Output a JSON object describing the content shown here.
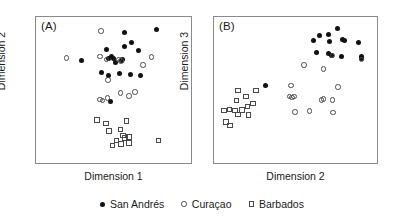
{
  "figure": {
    "panels": [
      {
        "letter": "(A)",
        "xlabel": "Dimension 1",
        "ylabel": "Dimension 2"
      },
      {
        "letter": "(B)",
        "xlabel": "Dimension 2",
        "ylabel": "Dimension 3"
      }
    ]
  },
  "legend": {
    "entries": [
      {
        "label": "San Andrés",
        "marker": "filled-circle"
      },
      {
        "label": "Curaçao",
        "marker": "open-circle"
      },
      {
        "label": "Barbados",
        "marker": "open-square"
      }
    ]
  },
  "chart_data": [
    {
      "type": "scatter",
      "title": "(A)",
      "xlabel": "Dimension 1",
      "ylabel": "Dimension 2",
      "xlim": [
        0,
        1
      ],
      "ylim": [
        0,
        1
      ],
      "grid": false,
      "axis_ticks": false,
      "legend_position": "bottom-outside",
      "series": [
        {
          "name": "San Andrés",
          "marker": "filled-circle",
          "color": "#111111",
          "points": [
            [
              0.572,
              0.108
            ],
            [
              0.775,
              0.084
            ],
            [
              0.452,
              0.223
            ],
            [
              0.573,
              0.203
            ],
            [
              0.617,
              0.176
            ],
            [
              0.662,
              0.23
            ],
            [
              0.291,
              0.3
            ],
            [
              0.47,
              0.281
            ],
            [
              0.49,
              0.272
            ],
            [
              0.497,
              0.284
            ],
            [
              0.553,
              0.297
            ],
            [
              0.56,
              0.288
            ],
            [
              0.515,
              0.312
            ],
            [
              0.42,
              0.383
            ],
            [
              0.465,
              0.4
            ],
            [
              0.54,
              0.385
            ],
            [
              0.61,
              0.395
            ],
            [
              0.675,
              0.4
            ],
            [
              0.482,
              0.58
            ]
          ]
        },
        {
          "name": "Curaçao",
          "marker": "open-circle",
          "color": "#4a4a4a",
          "points": [
            [
              0.42,
              0.095
            ],
            [
              0.197,
              0.28
            ],
            [
              0.413,
              0.27
            ],
            [
              0.455,
              0.29
            ],
            [
              0.535,
              0.292
            ],
            [
              0.548,
              0.3
            ],
            [
              0.745,
              0.275
            ],
            [
              0.69,
              0.33
            ],
            [
              0.466,
              0.432
            ],
            [
              0.545,
              0.52
            ],
            [
              0.462,
              0.555
            ],
            [
              0.6,
              0.54
            ],
            [
              0.638,
              0.512
            ],
            [
              0.412,
              0.565
            ],
            [
              0.43,
              0.572
            ]
          ]
        },
        {
          "name": "Barbados",
          "marker": "open-square",
          "color": "#4a4a4a",
          "points": [
            [
              0.395,
              0.705
            ],
            [
              0.452,
              0.73
            ],
            [
              0.585,
              0.712
            ],
            [
              0.47,
              0.78
            ],
            [
              0.545,
              0.77
            ],
            [
              0.56,
              0.81
            ],
            [
              0.575,
              0.83
            ],
            [
              0.6,
              0.822
            ],
            [
              0.52,
              0.845
            ],
            [
              0.548,
              0.87
            ],
            [
              0.495,
              0.88
            ],
            [
              0.6,
              0.862
            ],
            [
              0.79,
              0.845
            ]
          ]
        }
      ]
    },
    {
      "type": "scatter",
      "title": "(B)",
      "xlabel": "Dimension 2",
      "ylabel": "Dimension 3",
      "xlim": [
        0,
        1
      ],
      "ylim": [
        0,
        1
      ],
      "grid": false,
      "axis_ticks": false,
      "legend_position": "bottom-outside",
      "series": [
        {
          "name": "San Andrés",
          "marker": "filled-circle",
          "color": "#111111",
          "points": [
            [
              0.757,
              0.078
            ],
            [
              0.65,
              0.125
            ],
            [
              0.7,
              0.122
            ],
            [
              0.612,
              0.16
            ],
            [
              0.707,
              0.17
            ],
            [
              0.79,
              0.155
            ],
            [
              0.8,
              0.16
            ],
            [
              0.884,
              0.173
            ],
            [
              0.628,
              0.24
            ],
            [
              0.7,
              0.25
            ],
            [
              0.722,
              0.262
            ],
            [
              0.78,
              0.272
            ],
            [
              0.903,
              0.268
            ],
            [
              0.905,
              0.283
            ],
            [
              0.315,
              0.47
            ]
          ]
        },
        {
          "name": "Curaçao",
          "marker": "open-circle",
          "color": "#4a4a4a",
          "points": [
            [
              0.728,
              0.262
            ],
            [
              0.905,
              0.29
            ],
            [
              0.552,
              0.33
            ],
            [
              0.672,
              0.355
            ],
            [
              0.472,
              0.47
            ],
            [
              0.76,
              0.48
            ],
            [
              0.462,
              0.545
            ],
            [
              0.478,
              0.552
            ],
            [
              0.492,
              0.545
            ],
            [
              0.66,
              0.567
            ],
            [
              0.672,
              0.56
            ],
            [
              0.727,
              0.568
            ],
            [
              0.498,
              0.65
            ],
            [
              0.585,
              0.645
            ],
            [
              0.73,
              0.655
            ]
          ]
        },
        {
          "name": "Barbados",
          "marker": "open-square",
          "color": "#4a4a4a",
          "points": [
            [
              0.148,
              0.505
            ],
            [
              0.258,
              0.502
            ],
            [
              0.195,
              0.545
            ],
            [
              0.137,
              0.572
            ],
            [
              0.24,
              0.592
            ],
            [
              0.06,
              0.64
            ],
            [
              0.095,
              0.632
            ],
            [
              0.13,
              0.64
            ],
            [
              0.172,
              0.638
            ],
            [
              0.205,
              0.612
            ],
            [
              0.148,
              0.668
            ],
            [
              0.212,
              0.672
            ],
            [
              0.075,
              0.718
            ],
            [
              0.098,
              0.742
            ]
          ]
        }
      ]
    }
  ]
}
